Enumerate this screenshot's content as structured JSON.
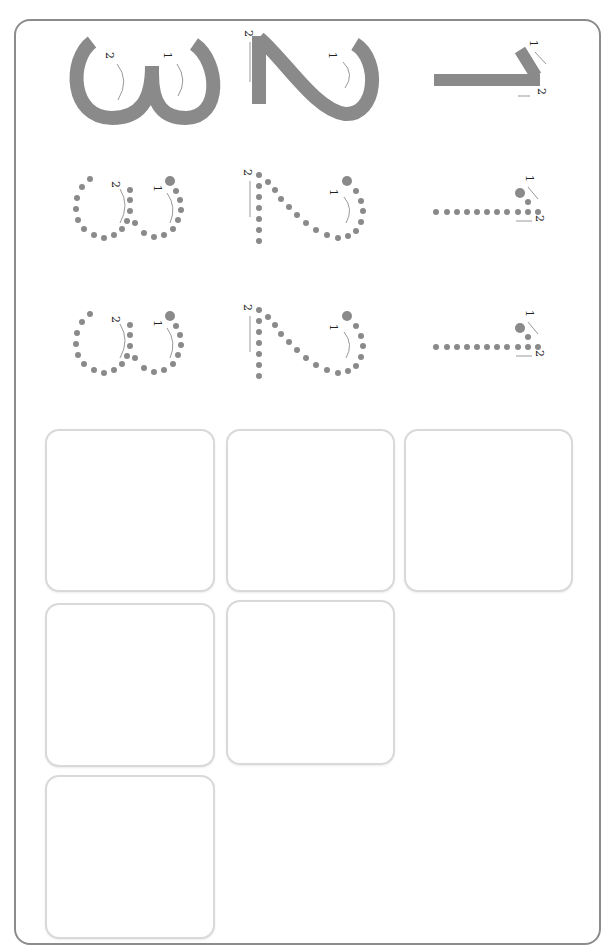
{
  "worksheet": {
    "title": "Digit tracing worksheet 1-2-3 (rotated)",
    "orientation": "rotated 90deg clockwise",
    "colors": {
      "border": "#8c8c8c",
      "stroke": "#8a8a8a",
      "dot": "#8a8a8a",
      "arrow": "#999999",
      "box_border": "#d9d9d9"
    },
    "digits": [
      {
        "digit": "3",
        "stroke_labels": [
          "1",
          "2"
        ]
      },
      {
        "digit": "2",
        "stroke_labels": [
          "1",
          "2"
        ]
      },
      {
        "digit": "1",
        "stroke_labels": [
          "1",
          "2"
        ]
      }
    ],
    "rows": [
      {
        "style": "solid",
        "label": "model"
      },
      {
        "style": "dotted",
        "label": "trace"
      },
      {
        "style": "dotted",
        "label": "trace"
      }
    ],
    "labels": {
      "one": "1",
      "two": "2"
    },
    "practice_boxes": 6
  }
}
